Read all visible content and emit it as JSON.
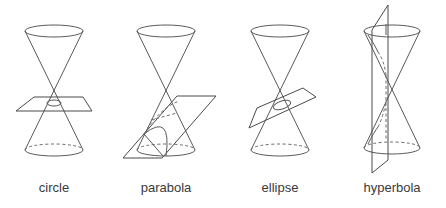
{
  "figure": {
    "line_color": "#555555",
    "background": "#ffffff",
    "panels": [
      {
        "id": "circle",
        "label": "circle",
        "description": "Horizontal plane slices the lower nappe perpendicular to the axis"
      },
      {
        "id": "parabola",
        "label": "parabola",
        "description": "Plane parallel to a generator slices the lower nappe"
      },
      {
        "id": "ellipse",
        "label": "ellipse",
        "description": "Tilted plane slices the lower nappe at an angle"
      },
      {
        "id": "hyperbola",
        "label": "hyperbola",
        "description": "Vertical plane slices both nappes"
      }
    ]
  }
}
